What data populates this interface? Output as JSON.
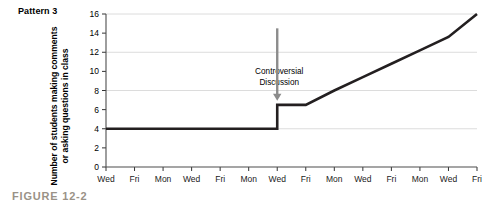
{
  "figure": {
    "pattern_label": "Pattern 3",
    "caption": "FIGURE 12-2",
    "caption_color": "#9a9287"
  },
  "chart_data": {
    "type": "line",
    "title": "Pattern 3",
    "xlabel": "",
    "ylabel": "Number of students making comments\nor asking questions in class",
    "ylim": [
      0,
      16
    ],
    "yticks": [
      0,
      2,
      4,
      6,
      8,
      10,
      12,
      14,
      16
    ],
    "ytick_labels": [
      "0",
      "2",
      "4",
      "6",
      "8",
      "10",
      "12",
      "14",
      "16"
    ],
    "gridlines_y": [
      4,
      8,
      12,
      16
    ],
    "grid": true,
    "legend": "none",
    "categories": [
      "Wed",
      "Fri",
      "Mon",
      "Wed",
      "Fri",
      "Mon",
      "Wed",
      "Fri",
      "Mon",
      "Wed",
      "Fri",
      "Mon",
      "Wed",
      "Fri"
    ],
    "x_indices": [
      0,
      1,
      2,
      3,
      4,
      5,
      6,
      7,
      8,
      9,
      10,
      11,
      12,
      13
    ],
    "series": [
      {
        "name": "Students making comments or asking questions",
        "color": "#231f20",
        "values": [
          4,
          4,
          4,
          4,
          4,
          4,
          4,
          6.5,
          8,
          9.4,
          10.8,
          12.2,
          13.6,
          16
        ],
        "jump_at_index": 6,
        "jump_from": 4,
        "jump_to": 6.5,
        "description": "Flat at 4 through the sixth tick, a vertical jump at the seventh tick (Wed) from 4 to 6.5, then a steady linear rise to 16 at the final tick (Fri)."
      }
    ],
    "annotations": [
      {
        "name": "controversial-discussion",
        "line1": "Controversial",
        "line2": "Discussion",
        "arrow": "down",
        "arrow_color": "#8c8c8c",
        "points_to_index": 6
      }
    ]
  },
  "axis": {
    "y_tick_color": "#333333",
    "grid_color": "#dcdcdc",
    "axis_color": "#4d4d4d"
  }
}
